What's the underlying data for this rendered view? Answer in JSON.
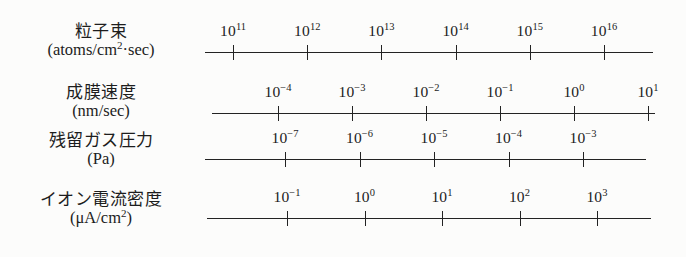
{
  "figure": {
    "background_color": "#fcfcfb",
    "ink_color": "#232323",
    "rows": [
      {
        "id": "particle-beam",
        "label_main": "粒子束",
        "label_unit_prefix": "(atoms/cm",
        "label_unit_sup": "2",
        "label_unit_suffix": "·sec)",
        "label_unit_plain": "(atoms/cm2·sec)",
        "axis": {
          "line_start_x": 205,
          "line_end_x": 653,
          "line_y": 52,
          "first_tick_x": 233,
          "tick_spacing": 74.2,
          "ticks": [
            {
              "mantissa": "10",
              "exponent": "11"
            },
            {
              "mantissa": "10",
              "exponent": "12"
            },
            {
              "mantissa": "10",
              "exponent": "13"
            },
            {
              "mantissa": "10",
              "exponent": "14"
            },
            {
              "mantissa": "10",
              "exponent": "15"
            },
            {
              "mantissa": "10",
              "exponent": "16"
            }
          ]
        }
      },
      {
        "id": "deposition-rate",
        "label_main": "成膜速度",
        "label_unit_prefix": "(nm/sec)",
        "label_unit_sup": "",
        "label_unit_suffix": "",
        "label_unit_plain": "(nm/sec)",
        "axis": {
          "line_start_x": 212,
          "line_end_x": 655,
          "line_y": 113,
          "first_tick_x": 278,
          "tick_spacing": 74.0,
          "ticks": [
            {
              "mantissa": "10",
              "exponent": "−4"
            },
            {
              "mantissa": "10",
              "exponent": "−3"
            },
            {
              "mantissa": "10",
              "exponent": "−2"
            },
            {
              "mantissa": "10",
              "exponent": "−1"
            },
            {
              "mantissa": "10",
              "exponent": "0"
            },
            {
              "mantissa": "10",
              "exponent": "1"
            }
          ]
        }
      },
      {
        "id": "residual-gas-pressure",
        "label_main": "残留ガス圧力",
        "label_unit_prefix": "(Pa)",
        "label_unit_sup": "",
        "label_unit_suffix": "",
        "label_unit_plain": "(Pa)",
        "axis": {
          "line_start_x": 205,
          "line_end_x": 646,
          "line_y": 159,
          "first_tick_x": 285,
          "tick_spacing": 74.5,
          "ticks": [
            {
              "mantissa": "10",
              "exponent": "−7"
            },
            {
              "mantissa": "10",
              "exponent": "−6"
            },
            {
              "mantissa": "10",
              "exponent": "−5"
            },
            {
              "mantissa": "10",
              "exponent": "−4"
            },
            {
              "mantissa": "10",
              "exponent": "−3"
            }
          ]
        }
      },
      {
        "id": "ion-current-density",
        "label_main": "イオン電流密度",
        "label_unit_prefix": "(μA/cm",
        "label_unit_sup": "2",
        "label_unit_suffix": ")",
        "label_unit_plain": "(μA/cm2)",
        "axis": {
          "line_start_x": 207,
          "line_end_x": 651,
          "line_y": 218,
          "first_tick_x": 287,
          "tick_spacing": 77.5,
          "ticks": [
            {
              "mantissa": "10",
              "exponent": "−1"
            },
            {
              "mantissa": "10",
              "exponent": "0"
            },
            {
              "mantissa": "10",
              "exponent": "1"
            },
            {
              "mantissa": "10",
              "exponent": "2"
            },
            {
              "mantissa": "10",
              "exponent": "3"
            }
          ]
        }
      }
    ]
  },
  "chart_data": {
    "type": "table",
    "title": "",
    "subtitle": "",
    "xlabel": "",
    "ylabel": "",
    "grid": false,
    "legend": "none",
    "series": [
      {
        "name": "粒子束 (atoms/cm2·sec)",
        "scale": "log10",
        "tick_exponents": [
          11,
          12,
          13,
          14,
          15,
          16
        ],
        "tick_labels": [
          "10^11",
          "10^12",
          "10^13",
          "10^14",
          "10^15",
          "10^16"
        ],
        "axis_range": [
          11,
          16
        ]
      },
      {
        "name": "成膜速度 (nm/sec)",
        "scale": "log10",
        "tick_exponents": [
          -4,
          -3,
          -2,
          -1,
          0,
          1
        ],
        "tick_labels": [
          "10^-4",
          "10^-3",
          "10^-2",
          "10^-1",
          "10^0",
          "10^1"
        ],
        "axis_range": [
          -4,
          1
        ]
      },
      {
        "name": "残留ガス圧力 (Pa)",
        "scale": "log10",
        "tick_exponents": [
          -7,
          -6,
          -5,
          -4,
          -3
        ],
        "tick_labels": [
          "10^-7",
          "10^-6",
          "10^-5",
          "10^-4",
          "10^-3"
        ],
        "axis_range": [
          -7,
          -3
        ]
      },
      {
        "name": "イオン電流密度 (μA/cm2)",
        "scale": "log10",
        "tick_exponents": [
          -1,
          0,
          1,
          2,
          3
        ],
        "tick_labels": [
          "10^-1",
          "10^0",
          "10^1",
          "10^2",
          "10^3"
        ],
        "axis_range": [
          -1,
          3
        ]
      }
    ]
  }
}
